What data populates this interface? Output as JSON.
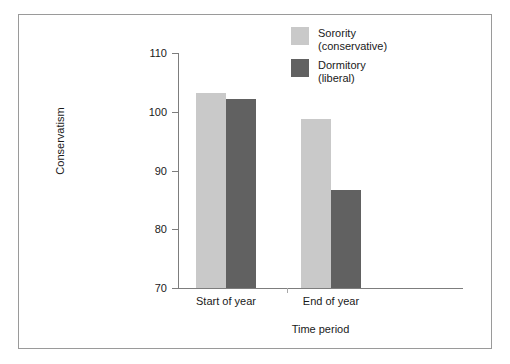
{
  "chart_data": {
    "type": "bar",
    "title": "",
    "subtitle": "",
    "xlabel": "Time period",
    "ylabel": "Conservatism",
    "categories": [
      "Start of year",
      "End of year"
    ],
    "series": [
      {
        "name": "Sorority",
        "qualifier": "(conservative)",
        "color": "#c9c9c9",
        "values": [
          103.2,
          98.8
        ]
      },
      {
        "name": "Dormitory",
        "qualifier": "(liberal)",
        "color": "#616161",
        "values": [
          102.1,
          86.7
        ]
      }
    ],
    "ylim": [
      70,
      110
    ],
    "yticks": [
      70,
      80,
      90,
      100,
      110
    ],
    "ytick_labels": [
      "70",
      "80",
      "90",
      "100",
      "110"
    ],
    "grid": false,
    "legend_position": "top-right",
    "legend": [
      {
        "label": "Sorority",
        "sub": "(conservative)",
        "color": "#c9c9c9"
      },
      {
        "label": "Dormitory",
        "sub": "(liberal)",
        "color": "#616161"
      }
    ],
    "axis_color": "#7d7d7d",
    "frame_color": "#9a9a9a",
    "background": "#ffffff"
  }
}
